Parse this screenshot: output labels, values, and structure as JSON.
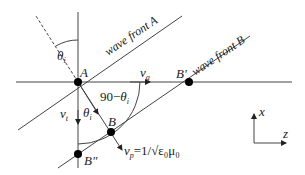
{
  "labels": {
    "theta_i_top": "θ",
    "theta_i_top_sub": "i",
    "point_A": "A",
    "wave_front_A": "wave front A",
    "v_g": "v",
    "v_g_sub": "g",
    "point_B_prime": "B′",
    "wave_front_B": "wave front B",
    "angle_90": "90−",
    "angle_90_theta": "θ",
    "angle_90_theta_sub": "i",
    "v_t": "v",
    "v_t_sub": "t",
    "theta_i_low": "θ",
    "theta_i_low_sub": "i",
    "point_B": "B",
    "point_B_dprime": "B″",
    "v_p": "v",
    "v_p_sub": "p",
    "v_p_formula": "=1/√ε₀μ₀",
    "axis_x": "x",
    "axis_z": "z"
  },
  "colors": {
    "line": "#333333",
    "point": "#000000"
  }
}
